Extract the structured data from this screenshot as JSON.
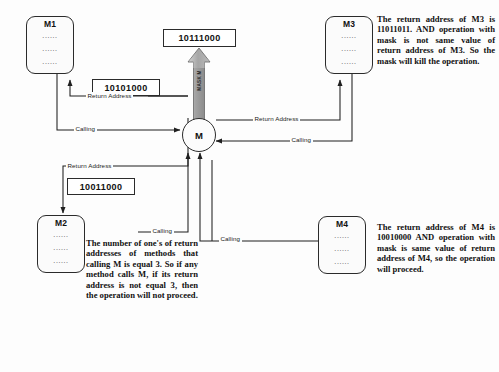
{
  "diagram": {
    "central_node": {
      "label": "M"
    },
    "mask": {
      "arrow_label": "MASK M",
      "value": "10111000"
    },
    "methods": [
      {
        "id": "m1",
        "label": "M1",
        "dots": "......"
      },
      {
        "id": "m2",
        "label": "M2",
        "dots": "......"
      },
      {
        "id": "m3",
        "label": "M3",
        "dots": "......"
      },
      {
        "id": "m4",
        "label": "M4",
        "dots": "......"
      }
    ],
    "return_addresses": [
      {
        "for": "M1",
        "value": "10101000"
      },
      {
        "for": "M2",
        "value": "10011000"
      }
    ],
    "edge_labels": {
      "m1_return": "Return Address",
      "m1_calling": "Calling",
      "m2_return": "Return Address",
      "m2_calling": "Calling",
      "m3_return": "Return Address",
      "m3_calling": "Calling",
      "m4_calling": "Calling"
    },
    "notes": {
      "m3": "The return address of M3 is 11011011. AND operation with mask is not same value of return address of M3. So the mask will kill the operation.",
      "m2": "The number of one's of return addresses of methods that calling M is equal 3. So if any method calls M, if its return address is not equal 3, then the operation will not proceed.",
      "m4": "The return address of M4 is 10010000 AND operation with mask is same value of return address of M4, so the operation will proceed."
    }
  },
  "colors": {
    "stroke": "#2b2b2b",
    "background": "#fdfdfd",
    "mask_arrow_fill": "#a8a8a8",
    "mask_arrow_edge": "#6f6f6f"
  }
}
